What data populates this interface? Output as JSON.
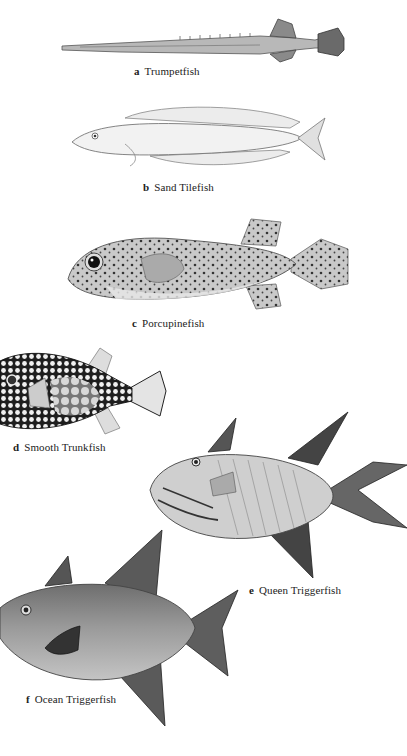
{
  "plate": {
    "figures": [
      {
        "letter": "a",
        "name": "Trumpetfish"
      },
      {
        "letter": "b",
        "name": "Sand Tilefish"
      },
      {
        "letter": "c",
        "name": "Porcupinefish"
      },
      {
        "letter": "d",
        "name": "Smooth Trunkfish"
      },
      {
        "letter": "e",
        "name": "Queen Triggerfish"
      },
      {
        "letter": "f",
        "name": "Ocean Triggerfish"
      }
    ]
  }
}
